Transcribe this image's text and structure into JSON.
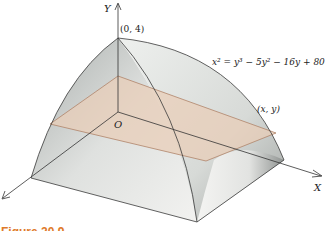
{
  "figure": {
    "type": "3d-solid-cross-section",
    "axes": {
      "y_label": "Y",
      "x_label": "X",
      "origin_label": "O"
    },
    "points": {
      "apex_label": "(0, 4)",
      "section_point_label": "(x, y)"
    },
    "equation": "x² = y³ − 5y² − 16y + 80",
    "caption": "Figure 20.9",
    "colors": {
      "solid_light": "#f2f2f0",
      "solid_shade": "#c9ccc9",
      "cross_section": "#e8cdb8",
      "cross_section_edge": "#b0846a",
      "edge": "#3a3a3a",
      "caption": "#e07a2a"
    }
  }
}
